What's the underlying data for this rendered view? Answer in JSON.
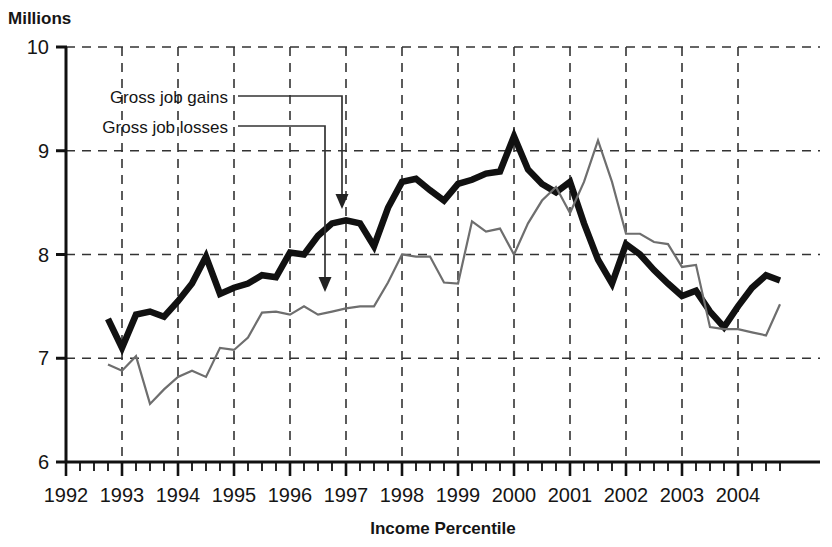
{
  "chart_data": {
    "type": "line",
    "title": "",
    "ylabel": "Millions",
    "xlabel": "Income Percentile",
    "ylim": [
      6,
      10
    ],
    "xlim": [
      1992,
      2004.85
    ],
    "grid": true,
    "y_ticks": [
      "10",
      "9",
      "8",
      "7",
      "6"
    ],
    "y_tick_values": [
      10,
      9,
      8,
      7,
      6
    ],
    "x_ticks": [
      "1992",
      "1993",
      "1994",
      "1995",
      "1996",
      "1997",
      "1998",
      "1999",
      "2000",
      "2001",
      "2002",
      "2003",
      "2004"
    ],
    "x_tick_values": [
      1992,
      1993,
      1994,
      1995,
      1996,
      1997,
      1998,
      1999,
      2000,
      2001,
      2002,
      2003,
      2004
    ],
    "minor_ticks_per_interval": 4,
    "legend_position": "inline-annotations",
    "series": [
      {
        "name": "Gross job gains",
        "style": "thick-black",
        "color": "#111111",
        "x": [
          1992.75,
          1993.0,
          1993.25,
          1993.5,
          1993.75,
          1994.0,
          1994.25,
          1994.5,
          1994.75,
          1995.0,
          1995.25,
          1995.5,
          1995.75,
          1996.0,
          1996.25,
          1996.5,
          1996.75,
          1997.0,
          1997.25,
          1997.5,
          1997.75,
          1998.0,
          1998.25,
          1998.5,
          1998.75,
          1999.0,
          1999.25,
          1999.5,
          1999.75,
          2000.0,
          2000.25,
          2000.5,
          2000.75,
          2001.0,
          2001.25,
          2001.5,
          2001.75,
          2002.0,
          2002.25,
          2002.5,
          2002.75,
          2003.0,
          2003.25,
          2003.5,
          2003.75,
          2004.0,
          2004.25,
          2004.5,
          2004.75
        ],
        "values": [
          7.38,
          7.1,
          7.42,
          7.45,
          7.4,
          7.55,
          7.72,
          7.98,
          7.62,
          7.68,
          7.72,
          7.8,
          7.78,
          8.02,
          8.0,
          8.18,
          8.3,
          8.33,
          8.3,
          8.08,
          8.45,
          8.7,
          8.73,
          8.62,
          8.52,
          8.68,
          8.72,
          8.78,
          8.8,
          9.14,
          8.82,
          8.68,
          8.6,
          8.7,
          8.3,
          7.95,
          7.72,
          8.1,
          8.0,
          7.85,
          7.72,
          7.6,
          7.65,
          7.45,
          7.3,
          7.5,
          7.68,
          7.8,
          7.75
        ]
      },
      {
        "name": "Gross job losses",
        "style": "thin-gray",
        "color": "#6e6e6e",
        "x": [
          1992.75,
          1993.0,
          1993.25,
          1993.5,
          1993.75,
          1994.0,
          1994.25,
          1994.5,
          1994.75,
          1995.0,
          1995.25,
          1995.5,
          1995.75,
          1996.0,
          1996.25,
          1996.5,
          1996.75,
          1997.0,
          1997.25,
          1997.5,
          1997.75,
          1998.0,
          1998.25,
          1998.5,
          1998.75,
          1999.0,
          1999.25,
          1999.5,
          1999.75,
          2000.0,
          2000.25,
          2000.5,
          2000.75,
          2001.0,
          2001.25,
          2001.5,
          2001.75,
          2002.0,
          2002.25,
          2002.5,
          2002.75,
          2003.0,
          2003.25,
          2003.5,
          2003.75,
          2004.0,
          2004.25,
          2004.5,
          2004.75
        ],
        "values": [
          6.94,
          6.88,
          7.02,
          6.56,
          6.7,
          6.82,
          6.88,
          6.82,
          7.1,
          7.08,
          7.2,
          7.44,
          7.45,
          7.42,
          7.5,
          7.42,
          7.45,
          7.48,
          7.5,
          7.5,
          7.73,
          8.0,
          7.98,
          7.98,
          7.73,
          7.72,
          8.32,
          8.22,
          8.25,
          8.0,
          8.3,
          8.52,
          8.65,
          8.4,
          8.7,
          9.1,
          8.7,
          8.2,
          8.2,
          8.12,
          8.1,
          7.88,
          7.9,
          7.3,
          7.28,
          7.28,
          7.25,
          7.22,
          7.52
        ]
      }
    ],
    "annotations": [
      {
        "label": "Gross job gains",
        "target_series": "Gross job gains",
        "target_x": 1997.3,
        "target_y": 8.42
      },
      {
        "label": "Gross job losses",
        "target_series": "Gross job losses",
        "target_x": 1996.6,
        "target_y": 7.62
      }
    ]
  }
}
